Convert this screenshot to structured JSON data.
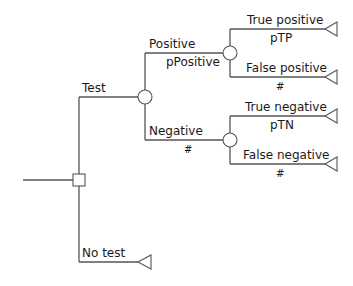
{
  "diagram": {
    "type": "decision-tree",
    "colors": {
      "line": "#555555",
      "text": "#1a1a1a",
      "background": "#ffffff"
    },
    "decision_node": {
      "branches": [
        "Test",
        "No test"
      ]
    },
    "labels": {
      "test": "Test",
      "no_test": "No test",
      "positive": "Positive",
      "positive_prob": "pPositive",
      "negative": "Negative",
      "negative_prob": "#",
      "true_positive": "True positive",
      "true_positive_prob": "pTP",
      "false_positive": "False positive",
      "false_positive_prob": "#",
      "true_negative": "True negative",
      "true_negative_prob": "pTN",
      "false_negative": "False negative",
      "false_negative_prob": "#"
    }
  }
}
